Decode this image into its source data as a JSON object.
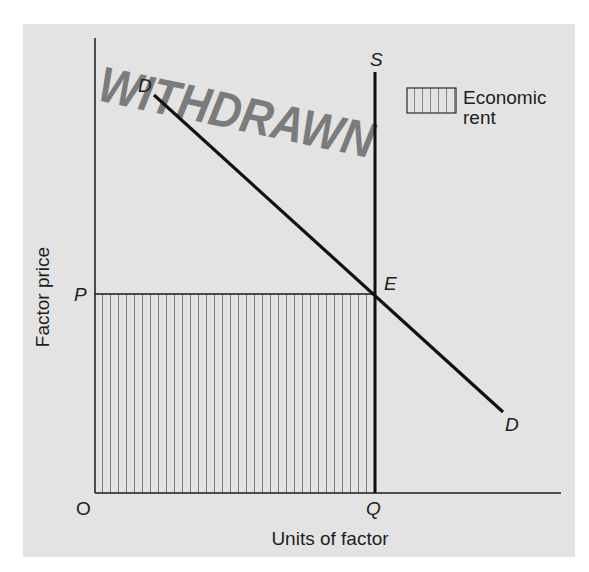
{
  "diagram": {
    "type": "supply-demand-factor-market",
    "background_color": "#e3e3e3",
    "line_color": "#1a1a1a",
    "axes": {
      "x_label": "Units of factor",
      "y_label": "Factor price",
      "origin_label": "O"
    },
    "points": {
      "price_level": "P",
      "quantity_level": "Q",
      "equilibrium": "E"
    },
    "curves": {
      "supply_label": "S",
      "demand_label_top": "D",
      "demand_label_bottom": "D"
    },
    "legend": {
      "swatch": "vertical-hatch",
      "label_line1": "Economic",
      "label_line2": "rent"
    },
    "stamp": {
      "text": "WITHDRAWN",
      "color": "#6a6a6a"
    },
    "shaded_region": {
      "meaning": "Economic rent",
      "bounds": "O to Q horizontally, 0 to P vertically"
    }
  }
}
